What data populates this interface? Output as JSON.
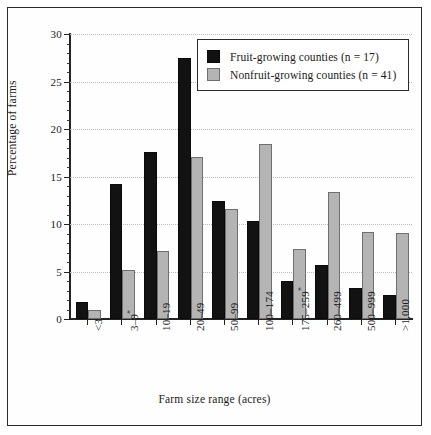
{
  "chart_data": {
    "type": "bar",
    "title": "",
    "xlabel": "Farm size range (acres)",
    "ylabel": "Percentage of farms",
    "categories": [
      "<3",
      "3–9*",
      "10–19",
      "20–49",
      "50–99",
      "100–174",
      "175–259*",
      "260–499",
      "500–999",
      ">1,000"
    ],
    "series": [
      {
        "name": "Fruit-growing counties (n = 17)",
        "color": "#121212",
        "values": [
          1.8,
          14.2,
          17.6,
          27.5,
          12.4,
          10.3,
          4.0,
          5.7,
          3.3,
          2.5
        ]
      },
      {
        "name": "Nonfruit-growing counties (n = 41)",
        "color": "#b4b4b4",
        "values": [
          1.0,
          5.2,
          7.2,
          17.1,
          11.6,
          18.4,
          7.4,
          13.4,
          9.2,
          9.1
        ]
      }
    ],
    "ylim": [
      0,
      30
    ],
    "yticks": [
      0,
      5,
      10,
      15,
      20,
      25,
      30
    ],
    "ytick_labels": [
      "0",
      "5",
      "10",
      "15",
      "20",
      "25",
      "30"
    ],
    "ytick_minor_step": 1,
    "grid": "horizontal-dotted",
    "legend_position": "top-right"
  },
  "legend": {
    "entries": [
      {
        "label": "Fruit-growing counties (n = 17)",
        "swatch": "black-square"
      },
      {
        "label": "Nonfruit-growing counties (n = 41)",
        "swatch": "gray-square"
      }
    ]
  },
  "axes": {
    "y_title": "Percentage of farms",
    "x_title": "Farm size range (acres)"
  }
}
